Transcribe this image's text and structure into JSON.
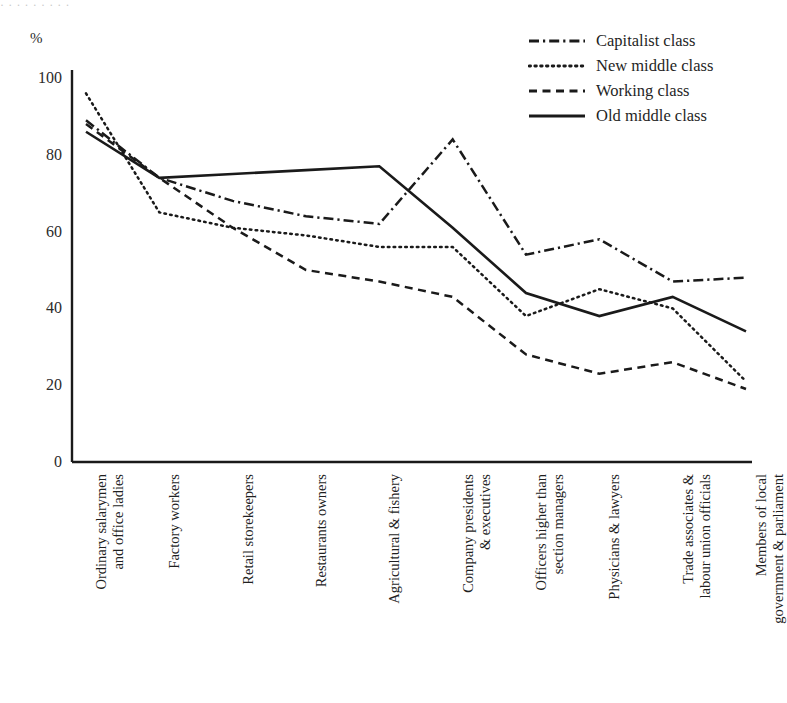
{
  "figure": {
    "top_artifact": "·   ·  ·                    ·  ·                              ·   ·      ·    ·",
    "background_color": "#ffffff",
    "ink_color": "#1a1a1a"
  },
  "legend": {
    "position": "top-right",
    "items": [
      {
        "label": "Capitalist class",
        "style": "dash-dot",
        "key_name": "legend-key-capitalist-class"
      },
      {
        "label": "New middle class",
        "style": "dotted",
        "key_name": "legend-key-new-middle-class"
      },
      {
        "label": "Working class",
        "style": "dashed",
        "key_name": "legend-key-working-class"
      },
      {
        "label": "Old middle class",
        "style": "solid",
        "key_name": "legend-key-old-middle-class"
      }
    ]
  },
  "chart_data": {
    "type": "line",
    "title": "",
    "xlabel": "",
    "ylabel": "%",
    "yunit": "%",
    "ylim": [
      0,
      100
    ],
    "yticks": [
      0,
      20,
      40,
      60,
      80,
      100
    ],
    "grid": false,
    "legend_position": "top-right",
    "categories": [
      "Ordinary salarymen\nand office ladies",
      "Factory workers",
      "Retail storekeepers",
      "Restaurants owners",
      "Agricultural & fishery",
      "Company presidents\n& executives",
      "Officers higher than\nsection managers",
      "Physicians & lawyers",
      "Trade associates &\nlabour union officials",
      "Members of local\ngovernment & parliament"
    ],
    "series": [
      {
        "name": "Capitalist class",
        "style": "dash-dot",
        "color": "#1a1a1a",
        "values": [
          89,
          74,
          68,
          64,
          62,
          84,
          54,
          58,
          47,
          48
        ]
      },
      {
        "name": "New middle class",
        "style": "dotted",
        "color": "#1a1a1a",
        "values": [
          96,
          65,
          61,
          59,
          56,
          56,
          38,
          45,
          40,
          21
        ]
      },
      {
        "name": "Working class",
        "style": "dashed",
        "color": "#1a1a1a",
        "values": [
          88,
          74,
          61,
          50,
          47,
          43,
          28,
          23,
          26,
          19
        ]
      },
      {
        "name": "Old middle class",
        "style": "solid",
        "color": "#1a1a1a",
        "values": [
          86,
          74,
          75,
          76,
          77,
          61,
          44,
          38,
          43,
          34
        ]
      }
    ]
  }
}
